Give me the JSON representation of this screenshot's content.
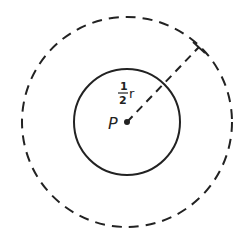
{
  "diagram": {
    "title": "",
    "center_label": "P",
    "radius_label_numerator": "1",
    "radius_label_denominator": "2",
    "radius_label_variable": "r",
    "radius_label_full": "1/2 r",
    "colors": {
      "stroke": "#222222",
      "background": "#ffffff"
    },
    "inner_circle": {
      "style": "solid",
      "cx": 127,
      "cy": 122,
      "r": 53
    },
    "outer_circle": {
      "style": "dashed",
      "cx": 127,
      "cy": 122,
      "r": 105
    },
    "radius_line": {
      "style": "dashed",
      "from": [
        127,
        122
      ],
      "to": [
        199,
        47
      ]
    }
  }
}
